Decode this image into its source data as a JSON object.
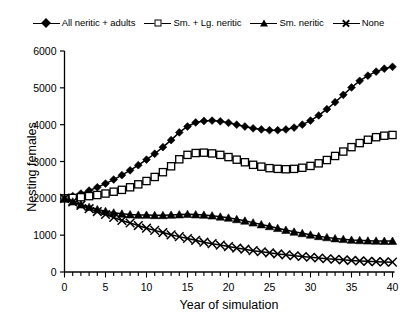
{
  "chart_data": {
    "type": "line",
    "title": "",
    "xlabel": "Year of simulation",
    "ylabel": "Nesting females",
    "xlim": [
      0,
      40
    ],
    "ylim": [
      0,
      6000
    ],
    "xticks": [
      0,
      5,
      10,
      15,
      20,
      25,
      30,
      35,
      40
    ],
    "yticks": [
      0,
      1000,
      2000,
      3000,
      4000,
      5000,
      6000
    ],
    "xtick_labels": [
      "0",
      "5",
      "10",
      "15",
      "20",
      "25",
      "30",
      "35",
      "40"
    ],
    "ytick_labels": [
      "0",
      "1000",
      "2000",
      "3000",
      "4000",
      "5000",
      "6000"
    ],
    "xminor_step": 1,
    "grid": false,
    "legend_position": "top",
    "x": [
      0,
      1,
      2,
      3,
      4,
      5,
      6,
      7,
      8,
      9,
      10,
      11,
      12,
      13,
      14,
      15,
      16,
      17,
      18,
      19,
      20,
      21,
      22,
      23,
      24,
      25,
      26,
      27,
      28,
      29,
      30,
      31,
      32,
      33,
      34,
      35,
      36,
      37,
      38,
      39,
      40
    ],
    "series": [
      {
        "name": "All neritic + adults",
        "marker": "diamond",
        "values": [
          2000,
          2060,
          2130,
          2210,
          2300,
          2400,
          2510,
          2630,
          2760,
          2900,
          3050,
          3210,
          3390,
          3580,
          3790,
          3950,
          4060,
          4100,
          4110,
          4090,
          4050,
          4000,
          3950,
          3900,
          3870,
          3850,
          3850,
          3870,
          3920,
          4000,
          4110,
          4250,
          4420,
          4610,
          4810,
          5010,
          5190,
          5330,
          5440,
          5520,
          5570
        ]
      },
      {
        "name": "Sm. + Lg. neritic",
        "marker": "square",
        "values": [
          2000,
          2010,
          2030,
          2060,
          2090,
          2130,
          2180,
          2230,
          2300,
          2380,
          2470,
          2580,
          2710,
          2870,
          3060,
          3180,
          3230,
          3240,
          3220,
          3180,
          3120,
          3050,
          2980,
          2910,
          2860,
          2820,
          2800,
          2790,
          2800,
          2830,
          2880,
          2950,
          3040,
          3150,
          3270,
          3390,
          3500,
          3590,
          3660,
          3700,
          3720
        ]
      },
      {
        "name": "Sm. neritic",
        "marker": "triangle",
        "values": [
          2000,
          1910,
          1830,
          1760,
          1700,
          1650,
          1610,
          1580,
          1560,
          1550,
          1550,
          1540,
          1540,
          1550,
          1560,
          1570,
          1560,
          1550,
          1530,
          1500,
          1470,
          1430,
          1390,
          1340,
          1290,
          1240,
          1190,
          1140,
          1090,
          1050,
          1010,
          970,
          940,
          910,
          890,
          870,
          860,
          850,
          845,
          842,
          840
        ]
      },
      {
        "name": "None",
        "marker": "cross",
        "values": [
          2000,
          1900,
          1810,
          1720,
          1640,
          1560,
          1480,
          1400,
          1330,
          1260,
          1190,
          1130,
          1070,
          1010,
          960,
          910,
          860,
          810,
          770,
          730,
          690,
          650,
          620,
          580,
          550,
          520,
          490,
          465,
          440,
          420,
          400,
          380,
          360,
          345,
          330,
          315,
          300,
          290,
          280,
          273,
          268
        ]
      }
    ]
  },
  "legend": {
    "entries": [
      {
        "label": "All neritic + adults",
        "marker": "diamond"
      },
      {
        "label": "Sm. + Lg. neritic",
        "marker": "square"
      },
      {
        "label": "Sm. neritic",
        "marker": "triangle"
      },
      {
        "label": "None",
        "marker": "cross"
      }
    ]
  },
  "axes": {
    "x_title": "Year of simulation",
    "y_title": "Nesting females"
  }
}
